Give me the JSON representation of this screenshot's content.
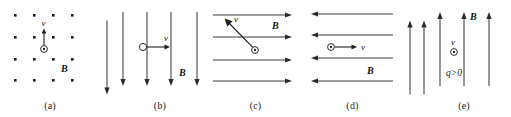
{
  "figure": {
    "background_color": "#ffffff",
    "line_color": "#3b3b3b",
    "text_color": "#111111",
    "panel_count": 5
  },
  "labels": {
    "B": "B",
    "v": "v",
    "charge_sign": "q>0"
  },
  "panels": [
    {
      "id": "a",
      "label": "(a)",
      "field_representation": "dots-out-of-page",
      "field_direction": "out of page",
      "field_label": "B",
      "dot_rows": 4,
      "dot_cols": 4,
      "charge_symbol": "circled-dot",
      "velocity_label": "v",
      "velocity_direction": "up",
      "extra_field_arrow_direction": "down"
    },
    {
      "id": "b",
      "label": "(b)",
      "field_representation": "vertical-arrows",
      "field_direction": "down",
      "field_label": "B",
      "field_line_count": 4,
      "charge_symbol": "open-circle",
      "velocity_label": "v",
      "velocity_direction": "right"
    },
    {
      "id": "c",
      "label": "(c)",
      "field_representation": "horizontal-arrows",
      "field_direction": "right",
      "field_label": "B",
      "field_line_count": 4,
      "charge_symbol": "circled-dot",
      "velocity_label": "v",
      "velocity_direction": "up-left diagonal"
    },
    {
      "id": "d",
      "label": "(d)",
      "field_representation": "horizontal-arrows",
      "field_direction": "left",
      "field_label": "B",
      "field_line_count": 4,
      "charge_symbol": "circled-dot",
      "velocity_label": "v",
      "velocity_direction": "right",
      "extra_field_arrow_direction": "up"
    },
    {
      "id": "e",
      "label": "(e)",
      "field_representation": "vertical-arrows",
      "field_direction": "up",
      "field_label": "B",
      "field_line_count": 4,
      "charge_symbol": "circled-dot",
      "velocity_label": "v",
      "velocity_direction": "out of page",
      "charge_sign_label": "q>0"
    }
  ]
}
